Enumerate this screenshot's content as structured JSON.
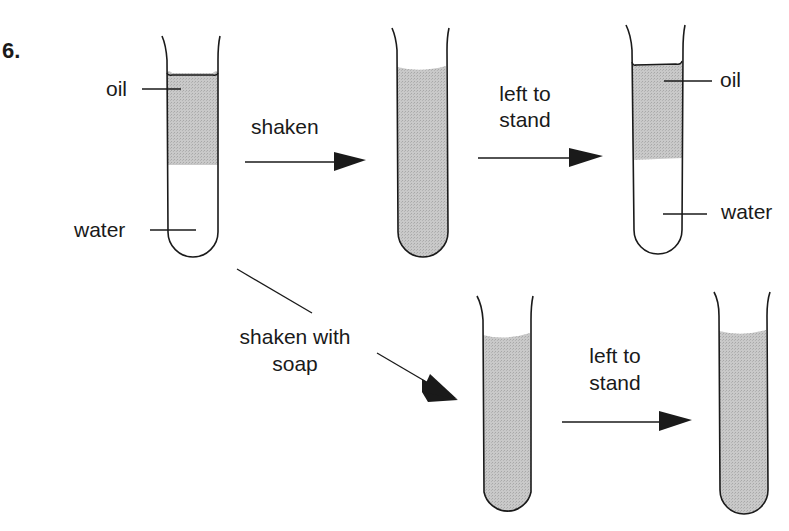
{
  "question_number": "6.",
  "colors": {
    "fill": "#c4c4c4",
    "stroke": "#1a1a1a",
    "background": "#ffffff"
  },
  "top_row": {
    "tube1": {
      "labels": {
        "top": "oil",
        "bottom": "water"
      },
      "state": "separated layers"
    },
    "arrow1": {
      "label": "shaken"
    },
    "tube2": {
      "state": "mixed (cloudy)"
    },
    "arrow2": {
      "label_line1": "left to",
      "label_line2": "stand"
    },
    "tube3": {
      "labels": {
        "top": "oil",
        "bottom": "water"
      },
      "state": "separated layers"
    }
  },
  "bottom_row": {
    "arrow3": {
      "label_line1": "shaken with",
      "label_line2": "soap"
    },
    "tube4": {
      "state": "emulsion"
    },
    "arrow4": {
      "label_line1": "left to",
      "label_line2": "stand"
    },
    "tube5": {
      "state": "emulsion remains"
    }
  }
}
